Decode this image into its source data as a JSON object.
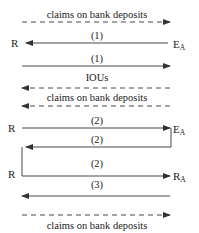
{
  "diagram": {
    "nodes": {
      "R": "R",
      "EA_main": "E",
      "EA_sub": "A",
      "RA_main": "R",
      "RA_sub": "A"
    },
    "labels": {
      "top_claims": "claims on bank deposits",
      "arrow1a": "(1)",
      "arrow1b": "(1)",
      "ious": "IOUs",
      "mid_claims": "claims on bank deposits",
      "arrow2a": "(2)",
      "arrow2b": "(2)",
      "arrow2c": "(2)",
      "arrow3": "(3)",
      "bottom_claims": "claims on bank deposits"
    },
    "colors": {
      "line": "#333333",
      "text": "#222222"
    }
  }
}
